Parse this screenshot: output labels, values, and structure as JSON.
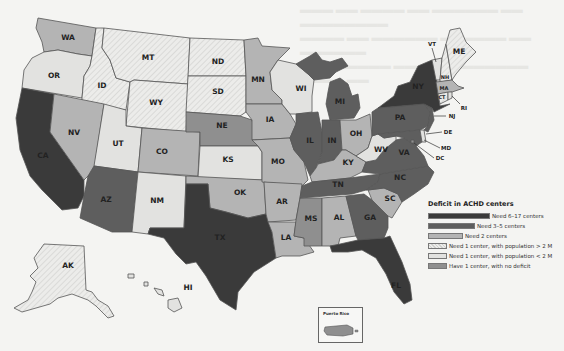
{
  "legend": {
    "title": "Deficit in ACHD centers",
    "items": [
      {
        "key": "need6to17",
        "label": "Need 6–17 centers",
        "color": "#3a3a3a",
        "width": 62
      },
      {
        "key": "need3to5",
        "label": "Need 3–5 centers",
        "color": "#5e5e5e",
        "width": 47
      },
      {
        "key": "need2",
        "label": "Need 2 centers",
        "color": "#b4b4b4",
        "width": 35
      },
      {
        "key": "need1big",
        "label": "Need 1 center, with population > 2 M",
        "color": "#ececea",
        "width": 19,
        "hatched": true
      },
      {
        "key": "need1small",
        "label": "Need 1 center, with population < 2 M",
        "color": "#e2e2e0",
        "width": 19
      },
      {
        "key": "nodeficit",
        "label": "Have 1 center, with no deficit",
        "color": "#8f8f8f",
        "width": 19
      }
    ]
  },
  "inset": {
    "title": "Puerto Rico"
  },
  "states": {
    "WA": "WA",
    "OR": "OR",
    "CA": "CA",
    "ID": "ID",
    "NV": "NV",
    "MT": "MT",
    "WY": "WY",
    "UT": "UT",
    "AZ": "AZ",
    "CO": "CO",
    "NM": "NM",
    "ND": "ND",
    "SD": "SD",
    "NE": "NE",
    "KS": "KS",
    "OK": "OK",
    "TX": "TX",
    "MN": "MN",
    "IA": "IA",
    "MO": "MO",
    "AR": "AR",
    "LA": "LA",
    "WI": "WI",
    "IL": "IL",
    "MS": "MS",
    "MI": "MI",
    "IN": "IN",
    "KY": "KY",
    "TN": "TN",
    "AL": "AL",
    "OH": "OH",
    "GA": "GA",
    "FL": "FL",
    "SC": "SC",
    "NC": "NC",
    "VA": "VA",
    "WV": "WV",
    "PA": "PA",
    "NY": "NY",
    "VT": "VT",
    "NH": "NH",
    "ME": "ME",
    "MA": "MA",
    "CT": "CT",
    "RI": "RI",
    "NJ": "NJ",
    "DE": "DE",
    "MD": "MD",
    "DC": "DC",
    "AK": "AK",
    "HI": "HI"
  },
  "state_categories": {
    "need6to17": [
      "CA",
      "TX",
      "NY",
      "FL"
    ],
    "need3to5": [
      "AZ",
      "IL",
      "IN",
      "MI",
      "PA",
      "TN",
      "NC",
      "VA",
      "GA",
      "NJ",
      "MD"
    ],
    "need2": [
      "WA",
      "NV",
      "CO",
      "MN",
      "IA",
      "MO",
      "OK",
      "AR",
      "LA",
      "KY",
      "OH",
      "AL",
      "SC",
      "MA"
    ],
    "need1big": [
      "MT",
      "ID",
      "WY",
      "ND",
      "SD",
      "AK",
      "ME",
      "NH",
      "CT"
    ],
    "need1small": [
      "OR",
      "UT",
      "NM",
      "KS",
      "WI",
      "WV",
      "VT",
      "RI",
      "DE",
      "HI"
    ],
    "nodeficit": [
      "NE",
      "MS",
      "DC",
      "PR"
    ]
  }
}
